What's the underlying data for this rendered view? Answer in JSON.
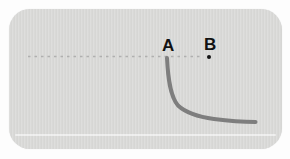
{
  "figure": {
    "panel": {
      "fill": "#d8d8d6",
      "background": "#fdfdfd"
    },
    "labels": {
      "a": "A",
      "b": "B"
    },
    "dashed_line": {
      "path": "M 28 56.5 L 203 56.5",
      "color": "#a8a8a8"
    },
    "curve": {
      "path": "M 167 58 C 168 78 170 96 178 105.5 C 186 113 199 117 214 119 C 229 121 243.5 122 255.5 122",
      "color": "#7e7e7e"
    },
    "point_b_dot": {
      "color": "#141414"
    }
  }
}
